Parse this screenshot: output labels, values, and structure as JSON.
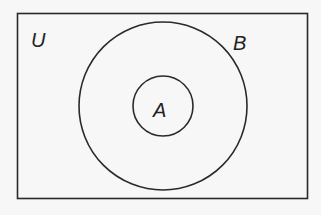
{
  "diagram": {
    "type": "venn",
    "universe": {
      "label": "U"
    },
    "sets": [
      {
        "label": "B",
        "contains": [
          "A"
        ]
      },
      {
        "label": "A",
        "subset_of": "B"
      }
    ],
    "colors": {
      "stroke": "#2a2a2a",
      "background": "#f7f7f7",
      "text": "#222222"
    }
  }
}
